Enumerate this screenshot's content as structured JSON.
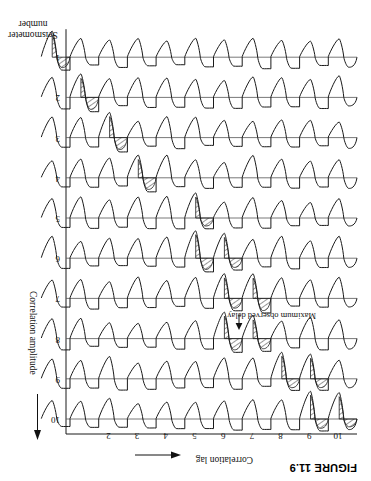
{
  "figure": {
    "label": "FIGURE 11.9"
  },
  "axes": {
    "x_axis_title": "Correlation lag",
    "x_axis_arrow": "arrow-left",
    "y_axis_title": "Correlation amplitude",
    "y_axis_arrow": "arrow-down",
    "row_axis_title_line1": "Seismometer",
    "row_axis_title_line2": "number",
    "x_ticks": [
      "10",
      "9",
      "8",
      "7",
      "6",
      "5",
      "4",
      "3",
      "2"
    ],
    "row_labels": [
      "10",
      "9",
      "8",
      "7",
      "6",
      "5",
      "4",
      "3",
      "2",
      "1"
    ]
  },
  "annotation": {
    "text": "Maximum observed delay",
    "pointer": "arrow-up"
  },
  "style": {
    "line_color": "#1a1a1a",
    "baseline_color": "#555555",
    "hatch_color": "#1a1a1a",
    "background": "#ffffff"
  },
  "chart_data": {
    "type": "line",
    "title": "FIGURE 11.9",
    "xlabel": "Correlation lag",
    "ylabel": "Correlation amplitude",
    "series_label": "Seismometer number",
    "xlim": [
      0,
      10.8
    ],
    "x_ticks": [
      10,
      9,
      8,
      7,
      6,
      5,
      4,
      3,
      2
    ],
    "grid": false,
    "legend": "none",
    "series": [
      {
        "name": "10",
        "row_index": 0,
        "peak_lag": 10.4,
        "shaded_cycles": [
          0,
          1
        ]
      },
      {
        "name": "9",
        "row_index": 1,
        "peak_lag": 9.5,
        "shaded_cycles": [
          1,
          2
        ]
      },
      {
        "name": "8",
        "row_index": 2,
        "peak_lag": 7.6,
        "shaded_cycles": [
          3,
          4
        ]
      },
      {
        "name": "7",
        "row_index": 3,
        "peak_lag": 7.0,
        "shaded_cycles": [
          3,
          4
        ]
      },
      {
        "name": "6",
        "row_index": 4,
        "peak_lag": 6.4,
        "shaded_cycles": [
          4,
          5
        ]
      },
      {
        "name": "5",
        "row_index": 5,
        "peak_lag": 5.4,
        "shaded_cycles": [
          5
        ]
      },
      {
        "name": "4",
        "row_index": 6,
        "peak_lag": 4.0,
        "shaded_cycles": [
          7
        ]
      },
      {
        "name": "3",
        "row_index": 7,
        "peak_lag": 3.0,
        "shaded_cycles": [
          8
        ]
      },
      {
        "name": "2",
        "row_index": 8,
        "peak_lag": 2.2,
        "shaded_cycles": [
          9
        ]
      },
      {
        "name": "1",
        "row_index": 9,
        "peak_lag": 1.4,
        "shaded_cycles": [
          10
        ]
      }
    ]
  }
}
